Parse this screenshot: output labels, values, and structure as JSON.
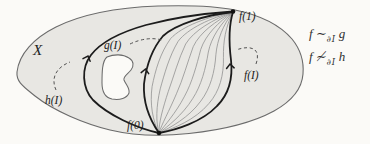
{
  "figure": {
    "space_label": "X",
    "point_labels": {
      "f0": "f(0)",
      "f1": "f(1)"
    },
    "path_labels": {
      "f": "f(I)",
      "g": "g(I)",
      "h": "h(I)"
    },
    "relations": [
      {
        "lhs": "f",
        "rel": "∼",
        "sub": "∂I",
        "rhs": "g"
      },
      {
        "lhs": "f",
        "rel": "≁",
        "sub": "∂I",
        "rhs": "h"
      }
    ],
    "colors": {
      "background": "#fbfaf7",
      "region_fill": "#e8e7e3",
      "region_outline": "#6b6b6b",
      "path_stroke": "#1c1c1c",
      "fan_stroke": "#8c8c8c",
      "label_text": "#222222"
    }
  }
}
